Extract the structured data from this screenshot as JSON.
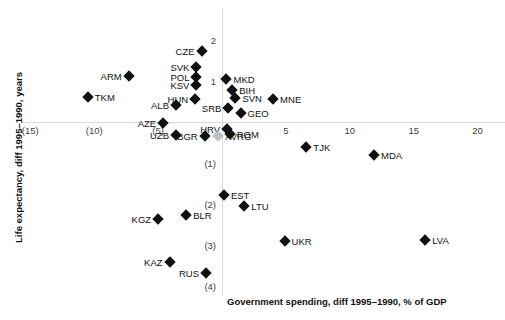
{
  "chart_data": {
    "type": "scatter",
    "title": "",
    "xlabel": "Government spending, diff 1995–1990, % of GDP",
    "ylabel": "Life expectancy, diff 1995–1990, years",
    "xlim": [
      -17,
      22
    ],
    "ylim": [
      -4.5,
      2.6
    ],
    "grid": false,
    "legend": false,
    "xticks": [
      {
        "value": -15,
        "label": "(15)"
      },
      {
        "value": -10,
        "label": "(10)"
      },
      {
        "value": -5,
        "label": "(5)"
      },
      {
        "value": 5,
        "label": "5"
      },
      {
        "value": 10,
        "label": "10"
      },
      {
        "value": 15,
        "label": "15"
      },
      {
        "value": 20,
        "label": "20"
      }
    ],
    "yticks": [
      {
        "value": 2,
        "label": "2"
      },
      {
        "value": 1,
        "label": "1"
      },
      {
        "value": -1,
        "label": "(1)"
      },
      {
        "value": -2,
        "label": "(2)"
      },
      {
        "value": -3,
        "label": "(3)"
      },
      {
        "value": -4,
        "label": "(4)"
      }
    ],
    "marker_color": "#111111",
    "average_marker_color": "#bfbfbf",
    "points": [
      {
        "label": "CZE",
        "x": -1.6,
        "y": 1.73,
        "label_side": "left"
      },
      {
        "label": "SVK",
        "x": -2.0,
        "y": 1.34,
        "label_side": "left"
      },
      {
        "label": "ARM",
        "x": -7.3,
        "y": 1.12,
        "label_side": "left"
      },
      {
        "label": "POL",
        "x": -2.0,
        "y": 1.1,
        "label_side": "left"
      },
      {
        "label": "KSV",
        "x": -2.0,
        "y": 0.9,
        "label_side": "left"
      },
      {
        "label": "MKD",
        "x": 0.35,
        "y": 1.05,
        "label_side": "right"
      },
      {
        "label": "BIH",
        "x": 0.8,
        "y": 0.78,
        "label_side": "right"
      },
      {
        "label": "SVN",
        "x": 1.05,
        "y": 0.58,
        "label_side": "right"
      },
      {
        "label": "HUN",
        "x": -2.1,
        "y": 0.56,
        "label_side": "left"
      },
      {
        "label": "SRB",
        "x": 0.5,
        "y": 0.35,
        "label_side": "left"
      },
      {
        "label": "TKM",
        "x": -10.5,
        "y": 0.62,
        "label_side": "right"
      },
      {
        "label": "ALB",
        "x": -3.6,
        "y": 0.42,
        "label_side": "left"
      },
      {
        "label": "MNE",
        "x": 4.0,
        "y": 0.56,
        "label_side": "right"
      },
      {
        "label": "GEO",
        "x": 1.45,
        "y": 0.22,
        "label_side": "right"
      },
      {
        "label": "HRV",
        "x": 0.4,
        "y": -0.18,
        "label_side": "left"
      },
      {
        "label": "AZE",
        "x": -4.6,
        "y": -0.02,
        "label_side": "left"
      },
      {
        "label": "ROM",
        "x": 0.6,
        "y": -0.3,
        "label_side": "right"
      },
      {
        "label": "UZB",
        "x": -3.6,
        "y": -0.32,
        "label_side": "left"
      },
      {
        "label": "AVRG",
        "x": -0.3,
        "y": -0.35,
        "label_side": "right",
        "is_average": true
      },
      {
        "label": "BGR",
        "x": -1.35,
        "y": -0.35,
        "label_side": "left"
      },
      {
        "label": "TJK",
        "x": 6.6,
        "y": -0.62,
        "label_side": "right"
      },
      {
        "label": "MDA",
        "x": 11.9,
        "y": -0.8,
        "label_side": "right"
      },
      {
        "label": "EST",
        "x": 0.15,
        "y": -1.78,
        "label_side": "right"
      },
      {
        "label": "LTU",
        "x": 1.75,
        "y": -2.05,
        "label_side": "right"
      },
      {
        "label": "BLR",
        "x": -2.8,
        "y": -2.27,
        "label_side": "right"
      },
      {
        "label": "KGZ",
        "x": -5.0,
        "y": -2.37,
        "label_side": "left"
      },
      {
        "label": "UKR",
        "x": 4.9,
        "y": -2.9,
        "label_side": "right"
      },
      {
        "label": "LVA",
        "x": 15.9,
        "y": -2.88,
        "label_side": "right"
      },
      {
        "label": "KAZ",
        "x": -4.1,
        "y": -3.42,
        "label_side": "left"
      },
      {
        "label": "RUS",
        "x": -1.25,
        "y": -3.68,
        "label_side": "left"
      }
    ]
  }
}
